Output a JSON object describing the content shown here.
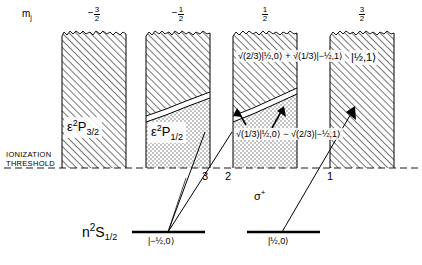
{
  "axis": {
    "mj_symbol": "m",
    "mj_subscript": "j",
    "headers": [
      {
        "sign": "−",
        "num": "3",
        "den": "2"
      },
      {
        "sign": "−",
        "num": "1",
        "den": "2"
      },
      {
        "sign": "",
        "num": "1",
        "den": "2"
      },
      {
        "sign": "",
        "num": "3",
        "den": "2"
      }
    ]
  },
  "continuum_columns": [
    {
      "name": "column-mj-minus-3-2",
      "term_epsilon": "ε",
      "term_mult": "2",
      "term_letter": "P",
      "term_j": "3/2",
      "ket": ""
    },
    {
      "name": "column-mj-minus-1-2",
      "term_epsilon": "ε",
      "term_mult": "2",
      "term_letter": "P",
      "term_j": "1/2",
      "ket": ""
    },
    {
      "name": "column-mj-plus-1-2",
      "ket_upper": "√(2/3)|½,0⟩ + √(1/3)|−½,1⟩",
      "ket_lower": "√(1/3)|½,0⟩ − √(2/3)|−½,1⟩"
    },
    {
      "name": "column-mj-plus-3-2",
      "ket_upper": "|½,1⟩"
    }
  ],
  "threshold": {
    "line1": "IONIZATION",
    "line2": "THRESHOLD"
  },
  "transitions": {
    "labels": [
      "3",
      "2",
      "1"
    ],
    "polarization": "σ",
    "polarization_sup": "+"
  },
  "ground_state": {
    "term_n": "n",
    "term_mult": "2",
    "term_letter": "S",
    "term_j": "1/2",
    "sublevels": [
      {
        "ket": "|−½,0⟩"
      },
      {
        "ket": "|½,0⟩"
      }
    ]
  },
  "colors": {
    "ink": "#000000",
    "hatch": "#555555",
    "stipple": "#888888",
    "background": "#ffffff"
  }
}
